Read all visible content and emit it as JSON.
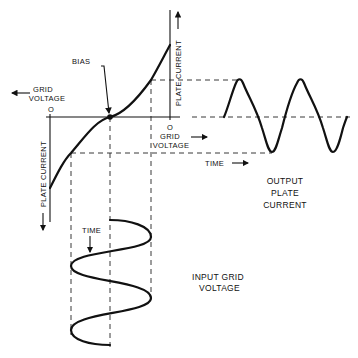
{
  "diagram": {
    "labels": {
      "bias": "BIAS",
      "grid_voltage_left_line1": "GRID",
      "grid_voltage_left_line2": "VOLTAGE",
      "zero_left": "O",
      "zero_right": "O",
      "grid_voltage_right_line1": "GRID",
      "grid_voltage_right_line2": "VOLTAGE",
      "plate_current_top": "PLATE CURRENT",
      "plate_current_bottom": "PLATE CURRENT",
      "time_output": "TIME",
      "time_input": "TIME",
      "output_line1": "OUTPUT",
      "output_line2": "PLATE",
      "output_line3": "CURRENT",
      "input_line1": "INPUT GRID",
      "input_line2": "VOLTAGE"
    },
    "icons": {
      "arrow_left": "arrow-left",
      "arrow_right": "arrow-right",
      "arrow_up": "arrow-up",
      "arrow_down": "arrow-down"
    },
    "colors": {
      "ink": "#111111",
      "background": "#ffffff"
    }
  }
}
